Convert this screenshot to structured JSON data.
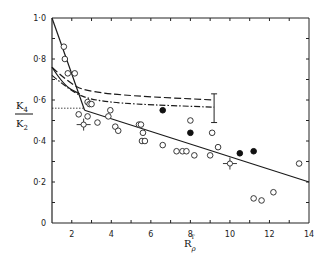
{
  "chart_data": {
    "type": "scatter",
    "title": "",
    "xlabel": "R_ρ^T",
    "ylabel": "K4/K2",
    "xlim": [
      1,
      14
    ],
    "ylim": [
      0,
      1.0
    ],
    "xticks": [
      "2",
      "4",
      "6",
      "8",
      "10",
      "12",
      "14"
    ],
    "yticks": [
      "0",
      "0·2",
      "0·4",
      "0·6",
      "0·8",
      "1·0"
    ],
    "grid": false,
    "series": [
      {
        "name": "open circles",
        "marker": "open-circle",
        "points": [
          [
            1.6,
            0.86
          ],
          [
            1.65,
            0.8
          ],
          [
            1.8,
            0.73
          ],
          [
            2.15,
            0.73
          ],
          [
            2.8,
            0.59
          ],
          [
            2.9,
            0.58
          ],
          [
            3.0,
            0.58
          ],
          [
            2.35,
            0.53
          ],
          [
            2.8,
            0.52
          ],
          [
            3.3,
            0.49
          ],
          [
            3.85,
            0.52
          ],
          [
            3.95,
            0.55
          ],
          [
            4.2,
            0.47
          ],
          [
            4.35,
            0.45
          ],
          [
            5.4,
            0.48
          ],
          [
            5.5,
            0.48
          ],
          [
            5.6,
            0.44
          ],
          [
            5.55,
            0.4
          ],
          [
            5.7,
            0.4
          ],
          [
            6.6,
            0.38
          ],
          [
            7.3,
            0.35
          ],
          [
            7.6,
            0.35
          ],
          [
            7.8,
            0.35
          ],
          [
            8.2,
            0.33
          ],
          [
            8.0,
            0.5
          ],
          [
            9.1,
            0.44
          ],
          [
            9.4,
            0.37
          ],
          [
            9.0,
            0.33
          ],
          [
            11.2,
            0.12
          ],
          [
            11.6,
            0.11
          ],
          [
            12.2,
            0.15
          ],
          [
            13.5,
            0.29
          ]
        ]
      },
      {
        "name": "filled circles",
        "marker": "filled-circle",
        "points": [
          [
            6.6,
            0.55
          ],
          [
            8.0,
            0.44
          ],
          [
            10.5,
            0.34
          ],
          [
            11.2,
            0.35
          ]
        ]
      },
      {
        "name": "points with error bars",
        "marker": "open-circle-errorbar",
        "points": [
          [
            2.6,
            0.48
          ],
          [
            10.0,
            0.29
          ]
        ]
      }
    ],
    "lines": [
      {
        "name": "steep solid line",
        "style": "solid",
        "points": [
          [
            1.0,
            1.0
          ],
          [
            2.65,
            0.55
          ]
        ]
      },
      {
        "name": "shallow solid line",
        "style": "solid",
        "points": [
          [
            2.65,
            0.55
          ],
          [
            14.0,
            0.2
          ]
        ]
      },
      {
        "name": "dashed curve",
        "style": "dashed",
        "points": [
          [
            1.0,
            0.76
          ],
          [
            2.0,
            0.67
          ],
          [
            3.0,
            0.64
          ],
          [
            5.0,
            0.62
          ],
          [
            9.2,
            0.6
          ]
        ]
      },
      {
        "name": "dash-dot curve",
        "style": "dash-dot",
        "points": [
          [
            1.0,
            0.72
          ],
          [
            2.0,
            0.64
          ],
          [
            3.0,
            0.6
          ],
          [
            5.0,
            0.58
          ],
          [
            9.2,
            0.565
          ]
        ]
      },
      {
        "name": "lower solid curve",
        "style": "solid",
        "points": [
          [
            1.0,
            0.76
          ],
          [
            1.6,
            0.67
          ],
          [
            2.4,
            0.63
          ]
        ]
      },
      {
        "name": "dotted reference",
        "style": "dotted",
        "points": [
          [
            1.0,
            0.56
          ],
          [
            2.6,
            0.56
          ]
        ]
      }
    ],
    "annotations": [
      {
        "type": "error-bar",
        "x": 9.2,
        "ymin": 0.49,
        "ymax": 0.63
      }
    ]
  },
  "axes": {
    "ylabel_top": "K",
    "ylabel_top_sub": "4",
    "ylabel_bottom": "K",
    "ylabel_bottom_sub": "2",
    "xlabel_main": "R",
    "xlabel_sub": "ρ",
    "xlabel_sup": "T"
  }
}
